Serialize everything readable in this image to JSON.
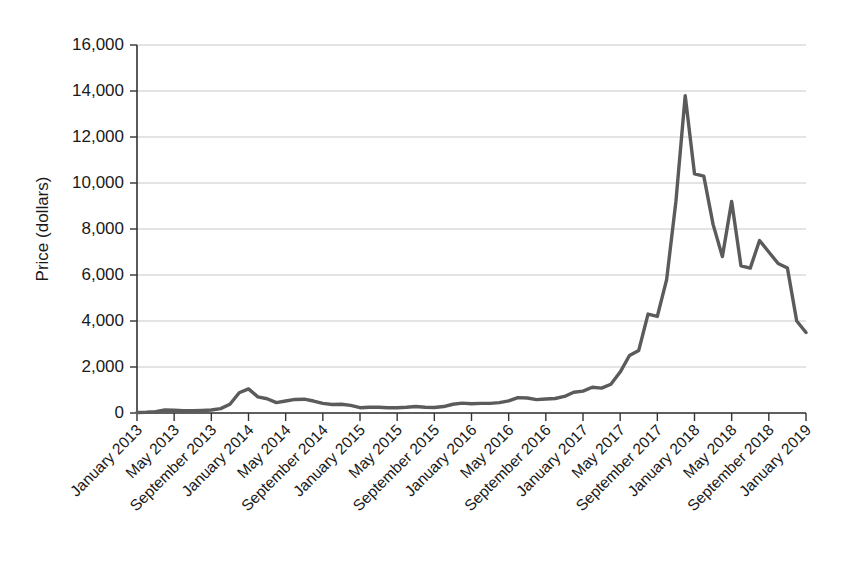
{
  "chart_data": {
    "type": "line",
    "title": "",
    "subtitle": "",
    "xlabel": "",
    "ylabel": "Price (dollars)",
    "ylim": [
      0,
      16000
    ],
    "ytick_labels": [
      "0",
      "2,000",
      "4,000",
      "6,000",
      "8,000",
      "10,000",
      "12,000",
      "14,000",
      "16,000"
    ],
    "ytick_values": [
      0,
      2000,
      4000,
      6000,
      8000,
      10000,
      12000,
      14000,
      16000
    ],
    "grid": "horizontal",
    "legend": "none",
    "series_color": "#5b5b5b",
    "xtick_labels": [
      "January 2013",
      "May 2013",
      "September 2013",
      "January 2014",
      "May 2014",
      "September 2014",
      "January 2015",
      "May 2015",
      "September 2015",
      "January 2016",
      "May 2016",
      "September 2016",
      "January 2017",
      "May 2017",
      "September 2017",
      "January 2018",
      "May 2018",
      "September 2018",
      "January 2019"
    ],
    "x": [
      "January 2013",
      "February 2013",
      "March 2013",
      "April 2013",
      "May 2013",
      "June 2013",
      "July 2013",
      "August 2013",
      "September 2013",
      "October 2013",
      "November 2013",
      "December 2013",
      "January 2014",
      "February 2014",
      "March 2014",
      "April 2014",
      "May 2014",
      "June 2014",
      "July 2014",
      "August 2014",
      "September 2014",
      "October 2014",
      "November 2014",
      "December 2014",
      "January 2015",
      "February 2015",
      "March 2015",
      "April 2015",
      "May 2015",
      "June 2015",
      "July 2015",
      "August 2015",
      "September 2015",
      "October 2015",
      "November 2015",
      "December 2015",
      "January 2016",
      "February 2016",
      "March 2016",
      "April 2016",
      "May 2016",
      "June 2016",
      "July 2016",
      "August 2016",
      "September 2016",
      "October 2016",
      "November 2016",
      "December 2016",
      "January 2017",
      "February 2017",
      "March 2017",
      "April 2017",
      "May 2017",
      "June 2017",
      "July 2017",
      "August 2017",
      "September 2017",
      "October 2017",
      "November 2017",
      "December 2017",
      "January 2018",
      "February 2018",
      "March 2018",
      "April 2018",
      "May 2018",
      "June 2018",
      "July 2018",
      "August 2018",
      "September 2018",
      "October 2018",
      "November 2018",
      "December 2018",
      "January 2019"
    ],
    "values": [
      20,
      30,
      60,
      130,
      120,
      100,
      95,
      110,
      130,
      190,
      380,
      880,
      1050,
      700,
      620,
      450,
      520,
      590,
      600,
      520,
      420,
      370,
      380,
      330,
      230,
      250,
      250,
      230,
      230,
      250,
      280,
      250,
      240,
      280,
      380,
      430,
      400,
      420,
      420,
      450,
      530,
      670,
      650,
      580,
      610,
      630,
      720,
      900,
      950,
      1120,
      1080,
      1250,
      1780,
      2500,
      2720,
      4300,
      4200,
      5800,
      9200,
      13800,
      10400,
      10300,
      8200,
      6800,
      9200,
      6400,
      6300,
      7500,
      7000,
      6500,
      6300,
      4000,
      3500
    ]
  }
}
